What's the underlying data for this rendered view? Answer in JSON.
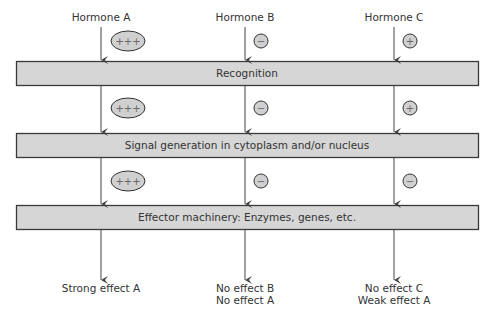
{
  "hormones": [
    {
      "label": "Hormone A",
      "modifiers": [
        "+++",
        "+++",
        "+++"
      ],
      "shapes": [
        "ellipse",
        "ellipse",
        "ellipse"
      ],
      "outcome": [
        "Strong effect A"
      ]
    },
    {
      "label": "Hormone B",
      "modifiers": [
        "−",
        "−",
        "−"
      ],
      "shapes": [
        "circle",
        "circle",
        "circle"
      ],
      "outcome": [
        "No effect B",
        "No effect A"
      ]
    },
    {
      "label": "Hormone C",
      "modifiers": [
        "+",
        "+",
        "−"
      ],
      "shapes": [
        "circle",
        "circle",
        "circle"
      ],
      "outcome": [
        "No effect C",
        "Weak effect A"
      ]
    }
  ],
  "stages": [
    {
      "label": "Recognition"
    },
    {
      "label": "Signal generation in cytoplasm and/or nucleus"
    },
    {
      "label": "Effector machinery: Enzymes, genes, etc."
    }
  ],
  "colors": {
    "box_fill": "#d6d6d6",
    "box_stroke": "#3a3a3a",
    "badge_fill": "#d0d0d0",
    "line": "#444444"
  }
}
